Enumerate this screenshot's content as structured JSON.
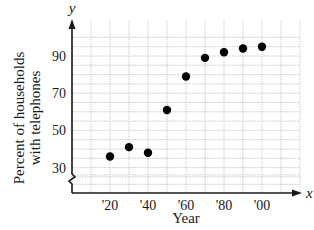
{
  "chart_data": {
    "type": "scatter",
    "title": "",
    "xlabel": "Year",
    "ylabel": "Percent of households with telephones",
    "ylabel_lines": [
      "Percent of households",
      "with telephones"
    ],
    "x_axis_symbol": "x",
    "y_axis_symbol": "y",
    "x_ticks": [
      "'20",
      "'40",
      "'60",
      "'80",
      "'00"
    ],
    "y_ticks": [
      "30",
      "50",
      "70",
      "90"
    ],
    "y_axis_break": true,
    "grid": true,
    "xlim": [
      1900,
      2020
    ],
    "ylim": [
      20,
      100
    ],
    "series": [
      {
        "name": "Households with telephones",
        "x": [
          1920,
          1930,
          1940,
          1950,
          1960,
          1970,
          1980,
          1990,
          2000
        ],
        "y": [
          36,
          41,
          38,
          61,
          79,
          89,
          92,
          94,
          95
        ]
      }
    ]
  },
  "colors": {
    "axis": "#1a1a1a",
    "grid": "#bdbdbd",
    "point": "#000000",
    "background": "#ffffff"
  }
}
